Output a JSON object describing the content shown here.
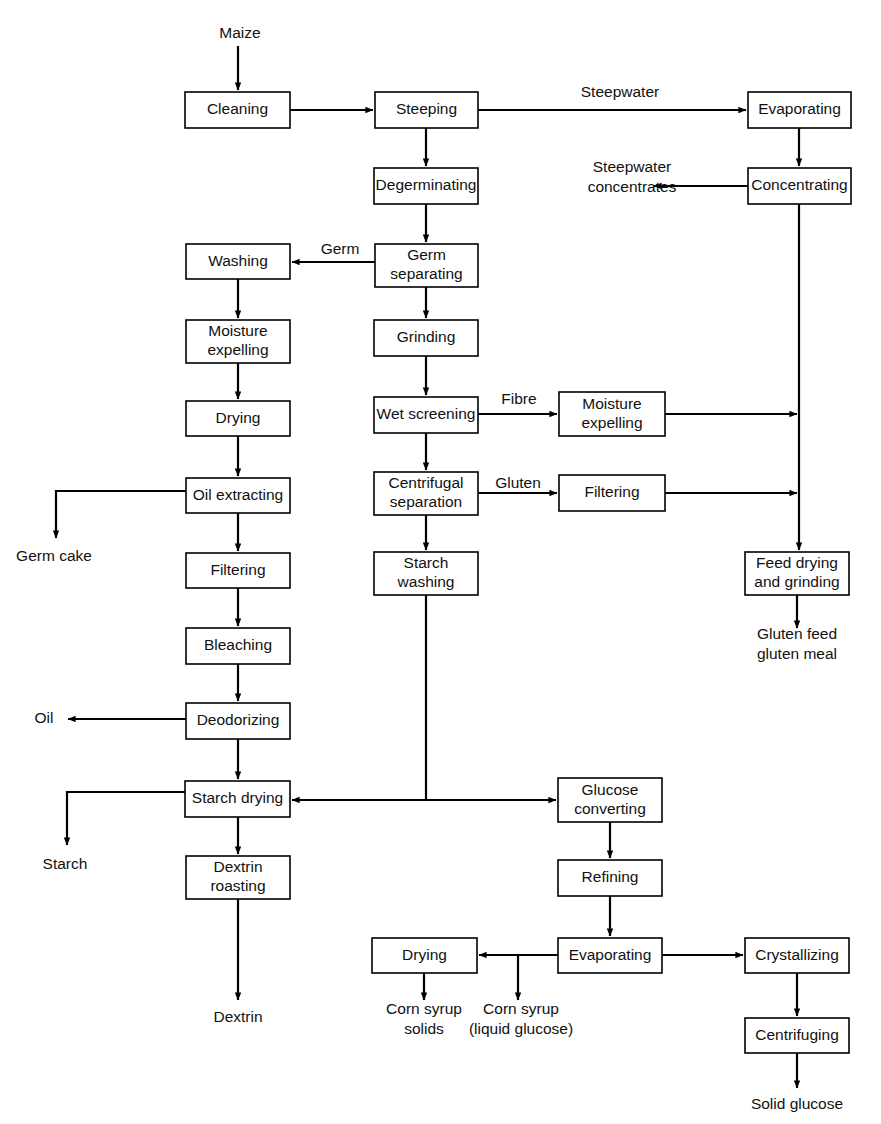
{
  "diagram": {
    "stroke_color": "#000000",
    "box_fill": "#ffffff",
    "text_color": "#111111"
  },
  "boxes": [
    {
      "id": "cleaning",
      "label": "Cleaning",
      "lines": [
        "Cleaning"
      ],
      "x": 185,
      "y": 92,
      "w": 105,
      "h": 36
    },
    {
      "id": "steeping",
      "label": "Steeping",
      "lines": [
        "Steeping"
      ],
      "x": 375,
      "y": 92,
      "w": 103,
      "h": 36
    },
    {
      "id": "evaporating1",
      "label": "Evaporating",
      "lines": [
        "Evaporating"
      ],
      "x": 748,
      "y": 92,
      "w": 103,
      "h": 36
    },
    {
      "id": "degerminating",
      "label": "Degerminating",
      "lines": [
        "Degerminating"
      ],
      "x": 374,
      "y": 168,
      "w": 104,
      "h": 36
    },
    {
      "id": "concentrating",
      "label": "Concentrating",
      "lines": [
        "Concentrating"
      ],
      "x": 748,
      "y": 168,
      "w": 103,
      "h": 36
    },
    {
      "id": "washing",
      "label": "Washing",
      "lines": [
        "Washing"
      ],
      "x": 186,
      "y": 244,
      "w": 104,
      "h": 35
    },
    {
      "id": "germ-separating",
      "label": "Germ separating",
      "lines": [
        "Germ",
        "separating"
      ],
      "x": 375,
      "y": 244,
      "w": 103,
      "h": 43
    },
    {
      "id": "moisture-exp-l",
      "label": "Moisture expelling",
      "lines": [
        "Moisture",
        "expelling"
      ],
      "x": 186,
      "y": 320,
      "w": 104,
      "h": 43
    },
    {
      "id": "grinding",
      "label": "Grinding",
      "lines": [
        "Grinding"
      ],
      "x": 374,
      "y": 320,
      "w": 104,
      "h": 36
    },
    {
      "id": "drying-germ",
      "label": "Drying",
      "lines": [
        "Drying"
      ],
      "x": 186,
      "y": 401,
      "w": 104,
      "h": 35
    },
    {
      "id": "wet-screening",
      "label": "Wet screening",
      "lines": [
        "Wet screening"
      ],
      "x": 374,
      "y": 397,
      "w": 104,
      "h": 36
    },
    {
      "id": "moisture-exp-r",
      "label": "Moisture expelling",
      "lines": [
        "Moisture",
        "expelling"
      ],
      "x": 559,
      "y": 392,
      "w": 106,
      "h": 44
    },
    {
      "id": "oil-extracting",
      "label": "Oil extracting",
      "lines": [
        "Oil extracting"
      ],
      "x": 186,
      "y": 478,
      "w": 104,
      "h": 35
    },
    {
      "id": "centrifugal-sep",
      "label": "Centrifugal separation",
      "lines": [
        "Centrifugal",
        "separation"
      ],
      "x": 374,
      "y": 472,
      "w": 104,
      "h": 43
    },
    {
      "id": "filtering-gluten",
      "label": "Filtering",
      "lines": [
        "Filtering"
      ],
      "x": 559,
      "y": 475,
      "w": 106,
      "h": 36
    },
    {
      "id": "filtering-oil",
      "label": "Filtering",
      "lines": [
        "Filtering"
      ],
      "x": 186,
      "y": 553,
      "w": 104,
      "h": 35
    },
    {
      "id": "starch-washing",
      "label": "Starch washing",
      "lines": [
        "Starch",
        "washing"
      ],
      "x": 374,
      "y": 552,
      "w": 104,
      "h": 43
    },
    {
      "id": "feed-drying",
      "label": "Feed drying and grinding",
      "lines": [
        "Feed drying",
        "and grinding"
      ],
      "x": 745,
      "y": 552,
      "w": 104,
      "h": 43
    },
    {
      "id": "bleaching",
      "label": "Bleaching",
      "lines": [
        "Bleaching"
      ],
      "x": 186,
      "y": 628,
      "w": 104,
      "h": 36
    },
    {
      "id": "deodorizing",
      "label": "Deodorizing",
      "lines": [
        "Deodorizing"
      ],
      "x": 186,
      "y": 703,
      "w": 104,
      "h": 36
    },
    {
      "id": "starch-drying",
      "label": "Starch drying",
      "lines": [
        "Starch drying"
      ],
      "x": 185,
      "y": 781,
      "w": 105,
      "h": 36
    },
    {
      "id": "glucose-conv",
      "label": "Glucose converting",
      "lines": [
        "Glucose",
        "converting"
      ],
      "x": 558,
      "y": 778,
      "w": 104,
      "h": 44
    },
    {
      "id": "dextrin-roasting",
      "label": "Dextrin roasting",
      "lines": [
        "Dextrin",
        "roasting"
      ],
      "x": 186,
      "y": 856,
      "w": 104,
      "h": 43
    },
    {
      "id": "refining",
      "label": "Refining",
      "lines": [
        "Refining"
      ],
      "x": 558,
      "y": 860,
      "w": 104,
      "h": 36
    },
    {
      "id": "drying-syrup",
      "label": "Drying",
      "lines": [
        "Drying"
      ],
      "x": 372,
      "y": 938,
      "w": 105,
      "h": 35
    },
    {
      "id": "evaporating2",
      "label": "Evaporating",
      "lines": [
        "Evaporating"
      ],
      "x": 558,
      "y": 938,
      "w": 104,
      "h": 35
    },
    {
      "id": "crystallizing",
      "label": "Crystallizing",
      "lines": [
        "Crystallizing"
      ],
      "x": 745,
      "y": 938,
      "w": 104,
      "h": 35
    },
    {
      "id": "centrifuging",
      "label": "Centrifuging",
      "lines": [
        "Centrifuging"
      ],
      "x": 745,
      "y": 1018,
      "w": 104,
      "h": 35
    }
  ],
  "free_labels": [
    {
      "id": "maize",
      "lines": [
        "Maize"
      ],
      "x": 240,
      "y": 34,
      "anchor": "middle"
    },
    {
      "id": "steepwater",
      "lines": [
        "Steepwater"
      ],
      "x": 620,
      "y": 93,
      "anchor": "middle"
    },
    {
      "id": "steepwater-conc",
      "lines": [
        "Steepwater",
        "concentrates"
      ],
      "x": 632,
      "y": 178,
      "anchor": "middle"
    },
    {
      "id": "germ",
      "lines": [
        "Germ"
      ],
      "x": 340,
      "y": 250,
      "anchor": "middle"
    },
    {
      "id": "fibre",
      "lines": [
        "Fibre"
      ],
      "x": 519,
      "y": 400,
      "anchor": "middle"
    },
    {
      "id": "gluten",
      "lines": [
        "Gluten"
      ],
      "x": 518,
      "y": 484,
      "anchor": "middle"
    },
    {
      "id": "germ-cake",
      "lines": [
        "Germ cake"
      ],
      "x": 54,
      "y": 557,
      "anchor": "middle"
    },
    {
      "id": "gluten-feed",
      "lines": [
        "Gluten feed",
        "gluten meal"
      ],
      "x": 797,
      "y": 645,
      "anchor": "middle"
    },
    {
      "id": "oil",
      "lines": [
        "Oil"
      ],
      "x": 44,
      "y": 719,
      "anchor": "middle"
    },
    {
      "id": "starch",
      "lines": [
        "Starch"
      ],
      "x": 65,
      "y": 865,
      "anchor": "middle"
    },
    {
      "id": "dextrin",
      "lines": [
        "Dextrin"
      ],
      "x": 238,
      "y": 1018,
      "anchor": "middle"
    },
    {
      "id": "corn-syrup-solids",
      "lines": [
        "Corn syrup",
        "solids"
      ],
      "x": 424,
      "y": 1020,
      "anchor": "middle"
    },
    {
      "id": "corn-syrup-liquid",
      "lines": [
        "Corn syrup",
        "(liquid glucose)"
      ],
      "x": 521,
      "y": 1020,
      "anchor": "middle"
    },
    {
      "id": "solid-glucose",
      "lines": [
        "Solid glucose"
      ],
      "x": 797,
      "y": 1105,
      "anchor": "middle"
    }
  ],
  "connections": [
    {
      "id": "maize-to-cleaning",
      "from": "maize",
      "to": "cleaning"
    },
    {
      "id": "cleaning-to-steeping",
      "from": "cleaning",
      "to": "steeping"
    },
    {
      "id": "steeping-to-evaporating",
      "from": "steeping",
      "to": "evaporating1",
      "label": "Steepwater"
    },
    {
      "id": "steeping-to-degerminating",
      "from": "steeping",
      "to": "degerminating"
    },
    {
      "id": "evaporating-to-concentrating",
      "from": "evaporating1",
      "to": "concentrating"
    },
    {
      "id": "concentrating-to-steepwater",
      "from": "concentrating",
      "to": "steepwater-concentrates"
    },
    {
      "id": "concentrating-to-feed-drying",
      "from": "concentrating",
      "to": "feed-drying"
    },
    {
      "id": "degerminating-to-germ-sep",
      "from": "degerminating",
      "to": "germ-separating"
    },
    {
      "id": "germ-sep-to-washing",
      "from": "germ-separating",
      "to": "washing",
      "label": "Germ"
    },
    {
      "id": "germ-sep-to-grinding",
      "from": "germ-separating",
      "to": "grinding"
    },
    {
      "id": "washing-to-moisture-exp",
      "from": "washing",
      "to": "moisture-exp-l"
    },
    {
      "id": "moisture-exp-to-drying",
      "from": "moisture-exp-l",
      "to": "drying-germ"
    },
    {
      "id": "drying-to-oil-extracting",
      "from": "drying-germ",
      "to": "oil-extracting"
    },
    {
      "id": "oil-extracting-to-germ-cake",
      "from": "oil-extracting",
      "to": "germ-cake"
    },
    {
      "id": "oil-extracting-to-filtering",
      "from": "oil-extracting",
      "to": "filtering-oil"
    },
    {
      "id": "filtering-to-bleaching",
      "from": "filtering-oil",
      "to": "bleaching"
    },
    {
      "id": "bleaching-to-deodorizing",
      "from": "bleaching",
      "to": "deodorizing"
    },
    {
      "id": "deodorizing-to-oil",
      "from": "deodorizing",
      "to": "oil"
    },
    {
      "id": "deodorizing-to-starch-drying",
      "from": "deodorizing",
      "to": "starch-drying"
    },
    {
      "id": "grinding-to-wet-screening",
      "from": "grinding",
      "to": "wet-screening"
    },
    {
      "id": "wet-screening-to-moisture-exp",
      "from": "wet-screening",
      "to": "moisture-exp-r",
      "label": "Fibre"
    },
    {
      "id": "wet-screening-to-centrifugal",
      "from": "wet-screening",
      "to": "centrifugal-sep"
    },
    {
      "id": "moisture-exp-r-to-trunk",
      "from": "moisture-exp-r",
      "to": "feed-drying"
    },
    {
      "id": "centrifugal-to-filtering",
      "from": "centrifugal-sep",
      "to": "filtering-gluten",
      "label": "Gluten"
    },
    {
      "id": "centrifugal-to-starch-washing",
      "from": "centrifugal-sep",
      "to": "starch-washing"
    },
    {
      "id": "filtering-gluten-to-trunk",
      "from": "filtering-gluten",
      "to": "feed-drying"
    },
    {
      "id": "feed-drying-to-gluten-feed",
      "from": "feed-drying",
      "to": "gluten-feed"
    },
    {
      "id": "starch-washing-to-glucose-conv",
      "from": "starch-washing",
      "to": "glucose-conv"
    },
    {
      "id": "glucose-conv-to-starch-drying",
      "from": "starch-washing",
      "to": "starch-drying"
    },
    {
      "id": "starch-drying-to-starch",
      "from": "starch-drying",
      "to": "starch"
    },
    {
      "id": "starch-drying-to-dextrin-roast",
      "from": "starch-drying",
      "to": "dextrin-roasting"
    },
    {
      "id": "dextrin-roast-to-dextrin",
      "from": "dextrin-roasting",
      "to": "dextrin"
    },
    {
      "id": "glucose-conv-to-refining",
      "from": "glucose-conv",
      "to": "refining"
    },
    {
      "id": "refining-to-evaporating",
      "from": "refining",
      "to": "evaporating2"
    },
    {
      "id": "evaporating-to-drying",
      "from": "evaporating2",
      "to": "drying-syrup"
    },
    {
      "id": "evaporating-to-corn-syrup",
      "from": "evaporating2",
      "to": "corn-syrup-liquid"
    },
    {
      "id": "evaporating-to-crystallizing",
      "from": "evaporating2",
      "to": "crystallizing"
    },
    {
      "id": "drying-to-corn-syrup-solids",
      "from": "drying-syrup",
      "to": "corn-syrup-solids"
    },
    {
      "id": "crystallizing-to-centrifuging",
      "from": "crystallizing",
      "to": "centrifuging"
    },
    {
      "id": "centrifuging-to-solid-glucose",
      "from": "centrifuging",
      "to": "solid-glucose"
    }
  ]
}
